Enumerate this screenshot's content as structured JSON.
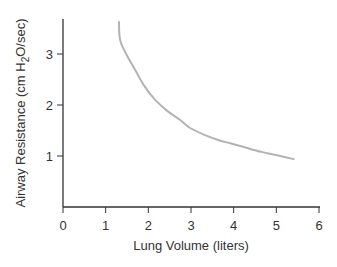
{
  "chart_data": {
    "type": "line",
    "title": "",
    "xlabel": "Lung Volume (liters)",
    "ylabel": "Airway Resistance (cm H2O/sec)",
    "ylabel_parts": {
      "pre": "Airway Resistance (cm H",
      "sub": "2",
      "post": "O/sec)"
    },
    "xlim": [
      0,
      6
    ],
    "ylim": [
      0,
      3.6
    ],
    "xticks": [
      0,
      1,
      2,
      3,
      4,
      5,
      6
    ],
    "yticks": [
      1,
      2,
      3
    ],
    "grid": false,
    "legend": null,
    "series": [
      {
        "name": "Airway resistance",
        "color": "#b3b3b3",
        "x": [
          1.31,
          1.34,
          1.5,
          1.69,
          1.9,
          2.16,
          2.45,
          2.74,
          2.98,
          3.3,
          3.62,
          3.96,
          4.3,
          4.65,
          4.99,
          5.41
        ],
        "y": [
          3.63,
          3.27,
          2.97,
          2.69,
          2.38,
          2.1,
          1.88,
          1.71,
          1.55,
          1.42,
          1.32,
          1.24,
          1.16,
          1.08,
          1.02,
          0.94
        ]
      }
    ]
  }
}
